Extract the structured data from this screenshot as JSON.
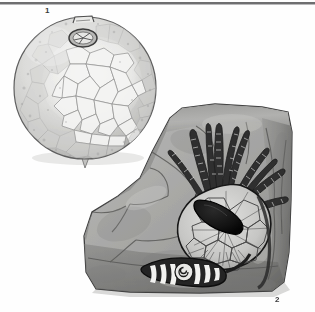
{
  "plate": {
    "width": 315,
    "height": 312,
    "background_color": "#fefefe",
    "rule_color": "#6e6e70",
    "type": "scientific-plate-illustration"
  },
  "figures": [
    {
      "number": "1",
      "name": "spherical-fossil",
      "description": "Spherical echinoderm test with polygonal plate mosaic texture, small apical attachment loop at top and dark stellate plate near upper centre, pointed basal process at bottom",
      "center_x": 85,
      "center_y": 88,
      "radius": 72,
      "fill_color": "#d8d8d6",
      "outline_color": "#6a6a6a"
    },
    {
      "number": "2",
      "name": "rock-slab-with-crinoid",
      "description": "Block of matrix rock preserving a crinoid / blastoid specimen: ten segmented arms radiating upward, plated calyx with dark teardrop-shaped cavity, and a banded segmented stem lying at the base",
      "fill_color": "#a5a5a3",
      "shadow_color": "#6e6e6c",
      "highlight_color": "#c9c9c7",
      "outline_color": "#4a4a4a",
      "parts": [
        {
          "name": "arms",
          "count": 10,
          "color": "#3a3a3a"
        },
        {
          "name": "calyx-plates",
          "color": "#cfcfcd"
        },
        {
          "name": "dark-cavity",
          "color": "#1a1a1a"
        },
        {
          "name": "segmented-stem",
          "color": "#2e2e2e",
          "band_color": "#f2f2f0"
        }
      ]
    }
  ],
  "labels": {
    "figure_1": "1",
    "figure_2": "2"
  }
}
